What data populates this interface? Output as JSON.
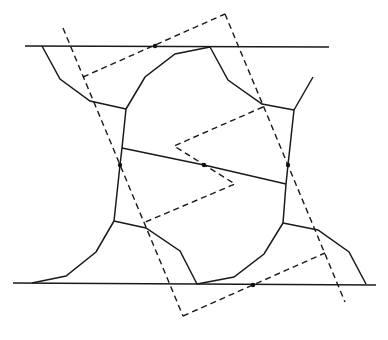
{
  "diagram": {
    "colors": {
      "stroke": "#1a1a1a",
      "background": "#ffffff"
    },
    "horizontal_lines": [
      {
        "name": "top-boundary-line",
        "x1": 25,
        "y1": 46,
        "x2": 329,
        "y2": 47
      },
      {
        "name": "bottom-boundary-line",
        "x1": 13,
        "y1": 283,
        "x2": 376,
        "y2": 285
      }
    ],
    "solid_polylines": [
      {
        "name": "upper-left-curve",
        "points": "42,46 60,79 90,101 126,109"
      },
      {
        "name": "central-top-arc",
        "points": "126,109 145,77 175,54 210,47"
      },
      {
        "name": "upper-right-curve",
        "points": "210,47 228,80 262,104 294,110"
      },
      {
        "name": "upper-right-branch",
        "points": "294,110 313,77"
      },
      {
        "name": "left-vertical",
        "points": "126,109 122,148 120,165 114,221"
      },
      {
        "name": "right-vertical",
        "points": "294,110 288,165 286,184 283,223"
      },
      {
        "name": "central-diagonal",
        "points": "122,148 204,165 286,184"
      },
      {
        "name": "lower-left-curve",
        "points": "114,221 96,252 66,276 32,283"
      },
      {
        "name": "central-bottom-arc",
        "points": "114,221 146,228 180,251 197,284"
      },
      {
        "name": "central-bottom-right-arc",
        "points": "197,284 234,277 264,254 283,223"
      },
      {
        "name": "lower-right-curve",
        "points": "283,223 318,230 349,252 366,284"
      }
    ],
    "dashed_polylines": [
      {
        "name": "dashed-left-side",
        "points": "63,28 183,316"
      },
      {
        "name": "dashed-right-side",
        "points": "225,14 345,302"
      },
      {
        "name": "dashed-top-side",
        "points": "83,77 225,14"
      },
      {
        "name": "dashed-bottom-side",
        "points": "183,316 325,253"
      },
      {
        "name": "dashed-zigzag",
        "points": "263,107 174,146 235,184 143,223"
      }
    ],
    "dots": [
      {
        "name": "top-line-dot",
        "cx": 155,
        "cy": 46
      },
      {
        "name": "left-vertical-dot",
        "cx": 120,
        "cy": 165
      },
      {
        "name": "center-dot",
        "cx": 204,
        "cy": 165
      },
      {
        "name": "right-vertical-dot",
        "cx": 288,
        "cy": 165
      },
      {
        "name": "bottom-line-dot",
        "cx": 253,
        "cy": 285
      }
    ]
  }
}
